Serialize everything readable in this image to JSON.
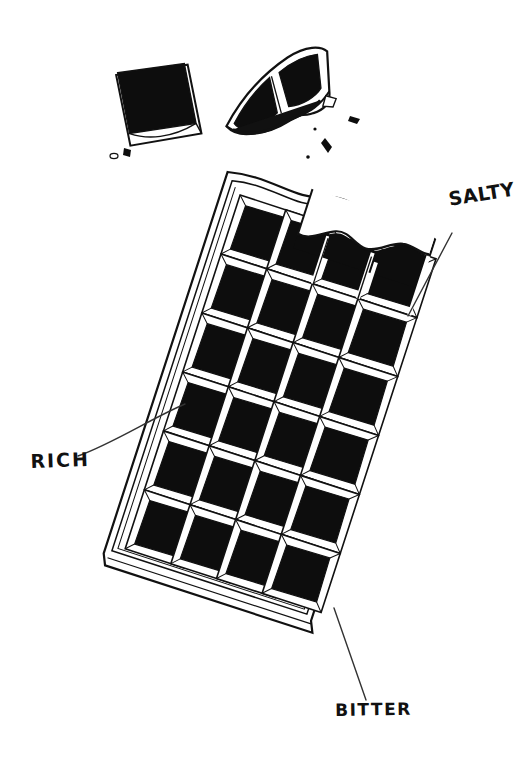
{
  "canvas": {
    "width": 527,
    "height": 773,
    "background_color": "#ffffff",
    "ink_color": "#111111"
  },
  "illustration": {
    "subject": "broken dark chocolate bar with bite taken out",
    "style": "hand-drawn ink line art, black fill",
    "bar": {
      "columns": 4,
      "rows": 6,
      "total_squares": 24,
      "rotation_degrees": 18,
      "top_edge": "bitten wavy edge"
    },
    "broken_pieces": 2,
    "crumbs": 6
  },
  "labels": {
    "salty": "SALTY",
    "rich": "RICH",
    "bitter": "BITTER"
  },
  "leader_lines": [
    {
      "name": "salty-leader",
      "from_x": 408,
      "from_y": 316,
      "to_x": 452,
      "to_y": 233
    },
    {
      "name": "rich-leader",
      "from_x": 78,
      "from_y": 456,
      "to_x": 185,
      "to_y": 404
    },
    {
      "name": "bitter-leader",
      "from_x": 334,
      "from_y": 608,
      "to_x": 366,
      "to_y": 700
    }
  ]
}
